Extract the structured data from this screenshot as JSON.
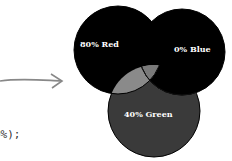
{
  "code_fragment": "0%);",
  "diagram": {
    "labels": {
      "red": "80% Red",
      "blue": "0% Blue",
      "green": "40% Green"
    },
    "colors": {
      "red": "#000000",
      "blue": "#000000",
      "green": "#3a3a3a",
      "red_green_overlap": "#8a8a8a",
      "red_blue_green_overlap": "#7a7a7a",
      "blue_green_overlap": "#333333",
      "arrow": "#888888"
    }
  }
}
